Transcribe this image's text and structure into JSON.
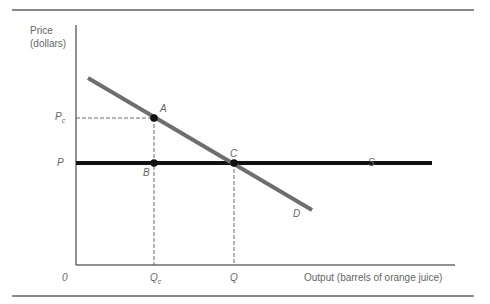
{
  "diagram": {
    "y_axis_label_line1": "Price",
    "y_axis_label_line2": "(dollars)",
    "x_axis_label": "Output (barrels of orange juice)",
    "origin_label": "0",
    "price_labels": {
      "pc_main": "P",
      "pc_sub": "c",
      "p": "P"
    },
    "quantity_labels": {
      "qc_main": "Q",
      "qc_sub": "c",
      "q": "Q"
    },
    "points": {
      "a": "A",
      "b": "B",
      "c": "C"
    },
    "curves": {
      "supply": "S",
      "demand": "D"
    },
    "colors": {
      "supply": "#111111",
      "demand": "#6e6e6e",
      "axes": "#222222",
      "guides": "#444444",
      "rules": "#8a8a8a"
    }
  }
}
